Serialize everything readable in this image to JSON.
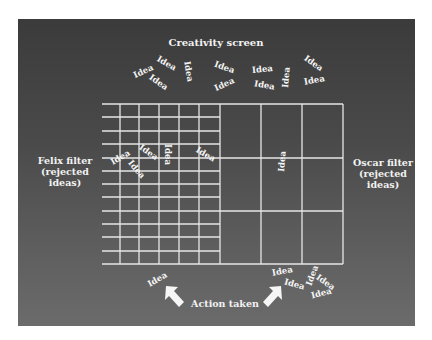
{
  "diagram": {
    "title": "Creativity screen",
    "left_filter": "Felix filter\n(rejected\nideas)",
    "right_filter": "Oscar filter\n(rejected\nideas)",
    "bottom_label": "Action taken",
    "idea_word": "Idea",
    "colors": {
      "background_top": "#3b3b3b",
      "background_bottom": "#6b6b6b",
      "foreground": "#f2f2f2",
      "grid_lines": "#e6e6e6"
    },
    "grid": {
      "fine_section": {
        "columns": 6,
        "rows": 12
      },
      "coarse_section": {
        "columns": 3,
        "rows": 3
      }
    },
    "ideas_top": [
      {
        "x": 143,
        "y": 72,
        "rot": -25
      },
      {
        "x": 166,
        "y": 64,
        "rot": 30
      },
      {
        "x": 158,
        "y": 83,
        "rot": 35
      },
      {
        "x": 188,
        "y": 72,
        "rot": 80
      },
      {
        "x": 224,
        "y": 68,
        "rot": 20
      },
      {
        "x": 224,
        "y": 85,
        "rot": -25
      },
      {
        "x": 262,
        "y": 70,
        "rot": -5
      },
      {
        "x": 264,
        "y": 86,
        "rot": 10
      },
      {
        "x": 286,
        "y": 78,
        "rot": -85
      },
      {
        "x": 313,
        "y": 64,
        "rot": 35
      },
      {
        "x": 314,
        "y": 81,
        "rot": -10
      }
    ],
    "ideas_grid": [
      {
        "x": 120,
        "y": 158,
        "rot": -30
      },
      {
        "x": 148,
        "y": 153,
        "rot": 35
      },
      {
        "x": 136,
        "y": 170,
        "rot": 50
      },
      {
        "x": 167,
        "y": 155,
        "rot": 90
      },
      {
        "x": 205,
        "y": 155,
        "rot": 30
      },
      {
        "x": 282,
        "y": 162,
        "rot": -85
      }
    ],
    "ideas_bottom": [
      {
        "x": 157,
        "y": 280,
        "rot": -30
      },
      {
        "x": 282,
        "y": 272,
        "rot": -10
      },
      {
        "x": 294,
        "y": 285,
        "rot": 15
      },
      {
        "x": 312,
        "y": 276,
        "rot": -70
      },
      {
        "x": 325,
        "y": 283,
        "rot": 35
      },
      {
        "x": 321,
        "y": 294,
        "rot": -15
      }
    ]
  }
}
